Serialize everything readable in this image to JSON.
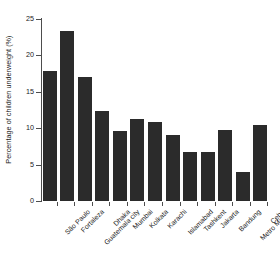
{
  "chart_data": {
    "type": "bar",
    "title": "",
    "xlabel": "",
    "ylabel": "Percentage of children underweight (%)",
    "ylim": [
      0,
      25
    ],
    "yticks": [
      0,
      5,
      10,
      15,
      20,
      25
    ],
    "ytick_labels": [
      "0",
      "5",
      "10",
      "15",
      "20",
      "25"
    ],
    "grid": false,
    "legend": null,
    "bar_color": "#2b2b2b",
    "axis_color": "#4d4d4d",
    "categories": [
      "São Paulo",
      "Fortaleza",
      "Guatemala city",
      "Dhaka",
      "Mumbai",
      "Kolkata",
      "Karachi",
      "Islamabad",
      "Tashkent",
      "Jakarta",
      "Bandung",
      "Metro Manila",
      "Cebu"
    ],
    "values": [
      17.9,
      23.4,
      17.1,
      12.3,
      9.6,
      11.2,
      10.9,
      9.0,
      6.7,
      6.8,
      9.8,
      4.0,
      10.4
    ]
  }
}
